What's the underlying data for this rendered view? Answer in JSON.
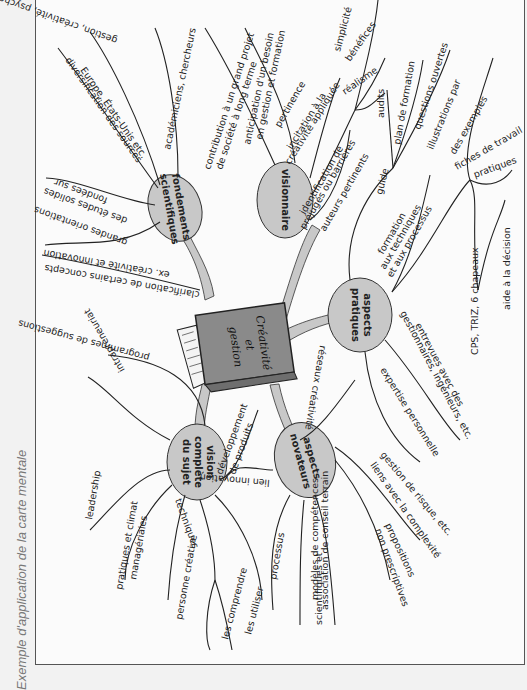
{
  "caption": "Exemple d'application de la carte mentale",
  "center": {
    "title_line1": "Créativité",
    "title_line2": "et",
    "title_line3": "gestion"
  },
  "nodes": {
    "fondements": {
      "line1": "fondements",
      "line2": "scientifiques"
    },
    "visionnaire": {
      "line1": "visionnaire"
    },
    "pratiques": {
      "line1": "aspects",
      "line2": "pratiques"
    },
    "novateurs": {
      "line1": "aspects",
      "line2": "novateurs"
    },
    "vision": {
      "line1": "vision",
      "line2": "complète",
      "line3": "du sujet"
    }
  },
  "branches": {
    "fondements": [
      "gestion, créativité, psychologie, etc.",
      "Europe, États-Unis etc.",
      "diversification des sources",
      "académiciens, chercheurs",
      "fondées sur",
      "des études solides",
      "grandes orientations",
      "ex. créativité et innovation",
      "clarification de certains concepts"
    ],
    "visionnaire": [
      "contribution à un grand projet",
      "de société à long terme",
      "anticipation d'un besoin",
      "en gestion et formation",
      "pertinence",
      "incitation à la",
      "créativité appliquée",
      "simplicité",
      "bénéfices",
      "réalisme",
      "identification de",
      "préjugés ou barrières",
      "auteurs pertinents"
    ],
    "pratiques": [
      "audits",
      "plan de formation",
      "questions ouvertes",
      "guide",
      "formation",
      "aux techniques",
      "et aux processus",
      "illustrations par",
      "des exemples",
      "fiches de travail",
      "pratiques",
      "CPS, TRIZ, 6 chapeaux",
      "aide à la décision",
      "gestionnaires, ingénieurs, etc.",
      "entrevues avec des",
      "expertise personnelle"
    ],
    "novateurs": [
      "réseaux créativité",
      "gestion de risque, etc.",
      "liens avec la complexité",
      "propositions",
      "non prescriptives",
      "association de conseil terrain",
      "scientifiques et",
      "modèles de compétences",
      "lien innovation"
    ],
    "vision": [
      "programmes de suggestions",
      "intrapreneuriat",
      "développement",
      "de produits",
      "leadership",
      "pratiques et climat",
      "managériales",
      "personne créative",
      "techniques",
      "les comprendre",
      "les utiliser",
      "processus"
    ]
  },
  "colors": {
    "node_fill": "#c8c8c8",
    "book_cover": "#8a8a8a",
    "line": "#222222",
    "page_bg": "#fbfbfb"
  }
}
